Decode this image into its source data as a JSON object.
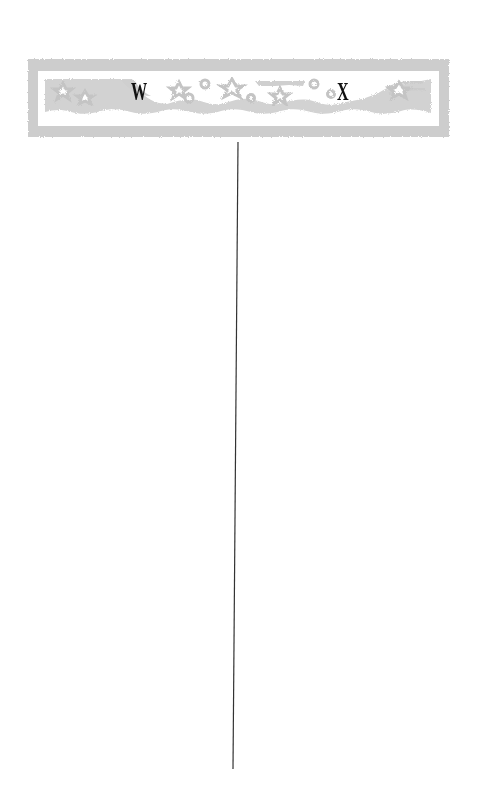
{
  "banner": {
    "letters": [
      "W",
      "X"
    ],
    "decoration": "stars-and-waves-border",
    "frame_color": "#c8c8c8",
    "band_color": "#cfcfcf",
    "letter_color": "#111111"
  },
  "divider": {
    "orientation": "vertical",
    "color": "#333333",
    "top": {
      "x": 238,
      "y": 142
    },
    "bottom": {
      "x": 233,
      "y": 769
    }
  },
  "columns": [
    {
      "letter": "W",
      "side": "left"
    },
    {
      "letter": "X",
      "side": "right"
    }
  ]
}
